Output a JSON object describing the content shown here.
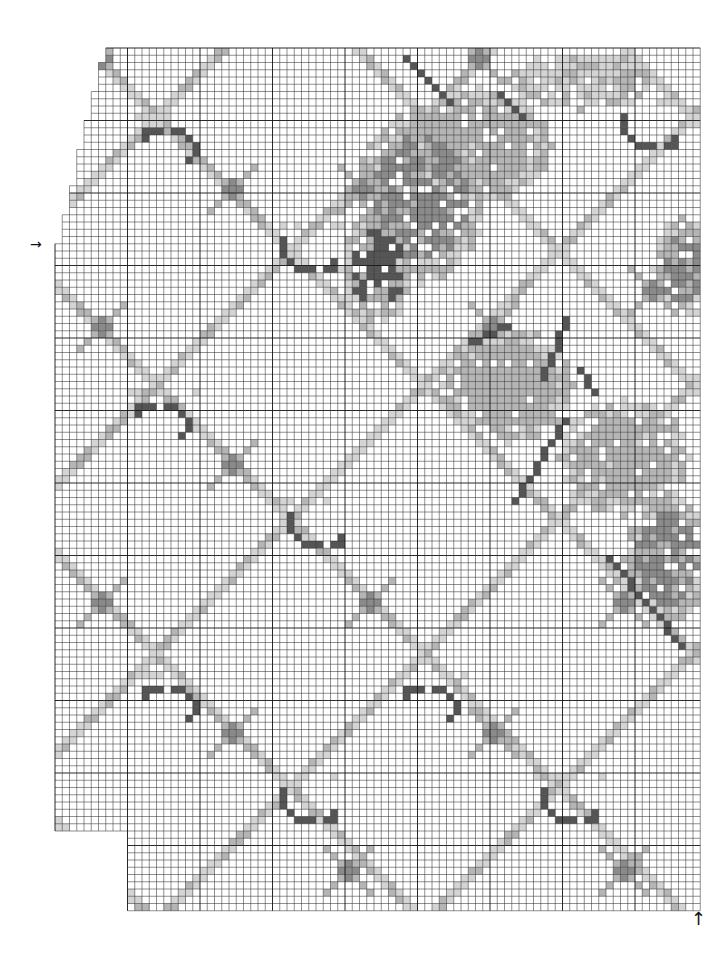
{
  "chart_data": {
    "type": "table",
    "title": "",
    "grid": {
      "origin_x": 55,
      "origin_y": 48,
      "cell": 7.25,
      "cols": 89,
      "rows": 119,
      "major_every": 10,
      "line_color": "#333333",
      "major_line_color": "#111111"
    },
    "row_extents": [
      {
        "from_row": 0,
        "to_row": 1,
        "start_col": 7
      },
      {
        "from_row": 2,
        "to_row": 5,
        "start_col": 6
      },
      {
        "from_row": 6,
        "to_row": 9,
        "start_col": 5
      },
      {
        "from_row": 10,
        "to_row": 13,
        "start_col": 4
      },
      {
        "from_row": 14,
        "to_row": 18,
        "start_col": 3
      },
      {
        "from_row": 19,
        "to_row": 22,
        "start_col": 2
      },
      {
        "from_row": 23,
        "to_row": 26,
        "start_col": 1
      },
      {
        "from_row": 27,
        "to_row": 107,
        "start_col": 0
      },
      {
        "from_row": 108,
        "to_row": 118,
        "start_col": 10
      }
    ],
    "palette": {
      "empty": "#ffffff",
      "light": "#d4d4d4",
      "mid": "#b5b5b5",
      "dark": "#8a8a8a",
      "darkest": "#555555"
    },
    "lattice": {
      "color": "#bdbdbd",
      "spacing": 37,
      "width": 2,
      "offset_down": 4,
      "offset_up": 22
    },
    "motifs": [
      {
        "type": "arc-right",
        "col": 12,
        "row": 11
      },
      {
        "type": "smile",
        "col": 31,
        "row": 26
      },
      {
        "type": "arc-right",
        "col": 11,
        "row": 49
      },
      {
        "type": "smile",
        "col": 32,
        "row": 64
      },
      {
        "type": "arc-right",
        "col": 12,
        "row": 88
      },
      {
        "type": "smile",
        "col": 31,
        "row": 102
      },
      {
        "type": "arc-right",
        "col": 48,
        "row": 88
      },
      {
        "type": "smile",
        "col": 67,
        "row": 102
      },
      {
        "type": "smile",
        "col": 78,
        "row": 9
      }
    ],
    "crosses": [
      {
        "col": 6,
        "row": 1
      },
      {
        "col": 24,
        "row": 19
      },
      {
        "col": 6,
        "row": 38
      },
      {
        "col": 24,
        "row": 57
      },
      {
        "col": 6,
        "row": 76
      },
      {
        "col": 24,
        "row": 94
      },
      {
        "col": 58,
        "row": 1
      },
      {
        "col": 42,
        "row": 19
      },
      {
        "col": 60,
        "row": 38
      },
      {
        "col": 43,
        "row": 76
      },
      {
        "col": 60,
        "row": 94
      },
      {
        "col": 78,
        "row": 76
      },
      {
        "col": 78,
        "row": 113
      },
      {
        "col": 40,
        "row": 113
      },
      {
        "col": 82,
        "row": 33
      }
    ],
    "blobs": [
      {
        "col": 50,
        "row": 20,
        "rx": 9,
        "ry": 12,
        "tone": "dark"
      },
      {
        "col": 58,
        "row": 13,
        "rx": 10,
        "ry": 8,
        "tone": "mid"
      },
      {
        "col": 44,
        "row": 30,
        "rx": 5,
        "ry": 8,
        "tone": "darkest"
      },
      {
        "col": 62,
        "row": 46,
        "rx": 9,
        "ry": 8,
        "tone": "mid"
      },
      {
        "col": 78,
        "row": 56,
        "rx": 9,
        "ry": 8,
        "tone": "mid"
      },
      {
        "col": 84,
        "row": 70,
        "rx": 6,
        "ry": 9,
        "tone": "dark"
      },
      {
        "col": 86,
        "row": 30,
        "rx": 4,
        "ry": 7,
        "tone": "dark"
      },
      {
        "col": 72,
        "row": 4,
        "rx": 10,
        "ry": 4,
        "tone": "light"
      }
    ],
    "dark_strokes": [
      {
        "from": [
          48,
          1
        ],
        "to": [
          54,
          7
        ]
      },
      {
        "from": [
          61,
          6
        ],
        "to": [
          64,
          9
        ]
      },
      {
        "from": [
          70,
          37
        ],
        "to": [
          67,
          45
        ]
      },
      {
        "from": [
          70,
          51
        ],
        "to": [
          63,
          62
        ]
      },
      {
        "from": [
          72,
          44
        ],
        "to": [
          74,
          47
        ]
      },
      {
        "from": [
          57,
          40
        ],
        "to": [
          62,
          38
        ]
      },
      {
        "from": [
          76,
          70
        ],
        "to": [
          86,
          82
        ]
      }
    ]
  },
  "markers": {
    "left_arrow": "→",
    "bottom_arrow": "↑"
  }
}
